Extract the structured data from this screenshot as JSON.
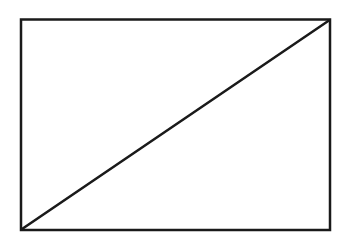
{
  "diagram": {
    "type": "rectangle-with-diagonal",
    "background": "#ffffff",
    "stroke_color": "#1a1a1a",
    "rectangle": {
      "x": 21,
      "y": 19.5,
      "width": 309,
      "height": 210.5,
      "stroke_width": 2.5
    },
    "diagonal": {
      "x1": 22,
      "y1": 229,
      "x2": 329,
      "y2": 20.5,
      "stroke_width": 2.5
    }
  }
}
